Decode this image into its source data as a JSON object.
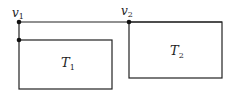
{
  "diagram": {
    "vertices": [
      {
        "id": "v1",
        "label": "v",
        "subscript": "1"
      },
      {
        "id": "v2",
        "label": "v",
        "subscript": "2"
      }
    ],
    "boxes": [
      {
        "id": "T1",
        "label": "T",
        "subscript": "1"
      },
      {
        "id": "T2",
        "label": "T",
        "subscript": "2"
      }
    ],
    "colors": {
      "stroke": "#222222",
      "background": "#ffffff"
    }
  }
}
